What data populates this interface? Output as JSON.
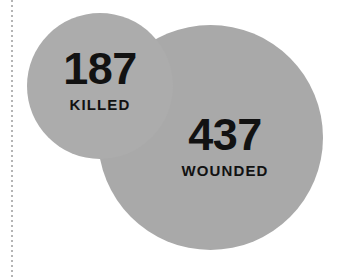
{
  "figure": {
    "type": "proportional-circles",
    "background_color": "#ffffff",
    "gutter_rule": {
      "name": "dotted-gutter-rule",
      "color": "#b4b4b4",
      "style": "dotted"
    }
  },
  "bubbles": [
    {
      "key": "killed",
      "value": "187",
      "caption": "KILLED",
      "color": "#acacac",
      "text_color": "#121212"
    },
    {
      "key": "wounded",
      "value": "437",
      "caption": "WOUNDED",
      "color": "#a9a9a9",
      "text_color": "#121212"
    }
  ],
  "chart_data": {
    "type": "bar",
    "title": "",
    "xlabel": "",
    "ylabel": "",
    "categories": [
      "KILLED",
      "WOUNDED"
    ],
    "values": [
      187,
      437
    ],
    "encoding": "circle-area-proportional",
    "series": [
      {
        "name": "Casualties",
        "values": [
          187,
          437
        ]
      }
    ],
    "legend": false,
    "grid": false,
    "annotations": [
      "187 KILLED",
      "437 WOUNDED"
    ]
  }
}
